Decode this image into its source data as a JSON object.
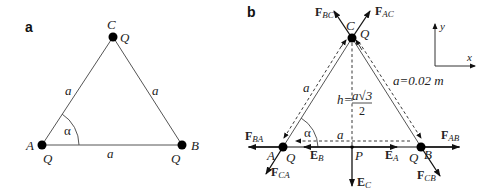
{
  "panel_a": {
    "label": "a",
    "vertices": {
      "A": {
        "label": "A",
        "charge": "Q"
      },
      "B": {
        "label": "B",
        "charge": "Q"
      },
      "C": {
        "label": "C",
        "charge": "Q"
      }
    },
    "sides": {
      "AC": "a",
      "BC": "a",
      "AB": "a"
    },
    "angle": "α"
  },
  "panel_b": {
    "label": "b",
    "vertices": {
      "A": {
        "label": "A",
        "charge": "Q"
      },
      "B": {
        "label": "B",
        "charge": "Q"
      },
      "C": {
        "label": "C",
        "charge": "Q"
      }
    },
    "point_p": "P",
    "side_left": "a",
    "side_right": "a=0.02 m",
    "side_bottom": "a",
    "angle": "α",
    "height_label": "h=",
    "height_num": "a√3",
    "height_den": "2",
    "forces": {
      "F_BC": {
        "main": "F",
        "sub": "BC"
      },
      "F_AC": {
        "main": "F",
        "sub": "AC"
      },
      "F_BA": {
        "main": "F",
        "sub": "BA"
      },
      "F_CA": {
        "main": "F",
        "sub": "CA"
      },
      "F_AB": {
        "main": "F",
        "sub": "AB"
      },
      "F_CB": {
        "main": "F",
        "sub": "CB"
      }
    },
    "fields": {
      "E_A": {
        "main": "E",
        "sub": "A"
      },
      "E_B": {
        "main": "E",
        "sub": "B"
      },
      "E_C": {
        "main": "E",
        "sub": "C"
      }
    },
    "axes": {
      "x": "x",
      "y": "y"
    }
  }
}
